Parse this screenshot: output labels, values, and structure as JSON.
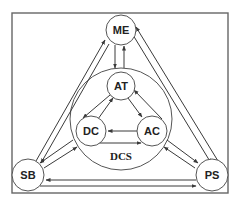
{
  "diagram": {
    "type": "node-link",
    "nodes": [
      {
        "id": "ME",
        "label": "ME"
      },
      {
        "id": "AT",
        "label": "AT"
      },
      {
        "id": "DC",
        "label": "DC"
      },
      {
        "id": "AC",
        "label": "AC"
      },
      {
        "id": "SB",
        "label": "SB"
      },
      {
        "id": "PS",
        "label": "PS"
      }
    ],
    "group": {
      "id": "DCS",
      "label": "DCS",
      "contains": [
        "AT",
        "DC",
        "AC"
      ]
    },
    "edges": [
      {
        "from": "ME",
        "to": "DCS"
      },
      {
        "from": "DCS",
        "to": "ME"
      },
      {
        "from": "AT",
        "to": "DC"
      },
      {
        "from": "DC",
        "to": "AT"
      },
      {
        "from": "AT",
        "to": "AC"
      },
      {
        "from": "AC",
        "to": "AT"
      },
      {
        "from": "AC",
        "to": "DC"
      },
      {
        "from": "DC",
        "to": "AC"
      },
      {
        "from": "SB",
        "to": "ME"
      },
      {
        "from": "ME",
        "to": "SB"
      },
      {
        "from": "PS",
        "to": "ME"
      },
      {
        "from": "ME",
        "to": "PS"
      },
      {
        "from": "DCS",
        "to": "SB"
      },
      {
        "from": "SB",
        "to": "DCS"
      },
      {
        "from": "DCS",
        "to": "PS"
      },
      {
        "from": "PS",
        "to": "DCS"
      },
      {
        "from": "PS",
        "to": "SB"
      },
      {
        "from": "SB",
        "to": "PS"
      }
    ]
  },
  "labels": {
    "me": "ME",
    "at": "AT",
    "dc": "DC",
    "ac": "AC",
    "sb": "SB",
    "ps": "PS",
    "dcs": "DCS"
  }
}
